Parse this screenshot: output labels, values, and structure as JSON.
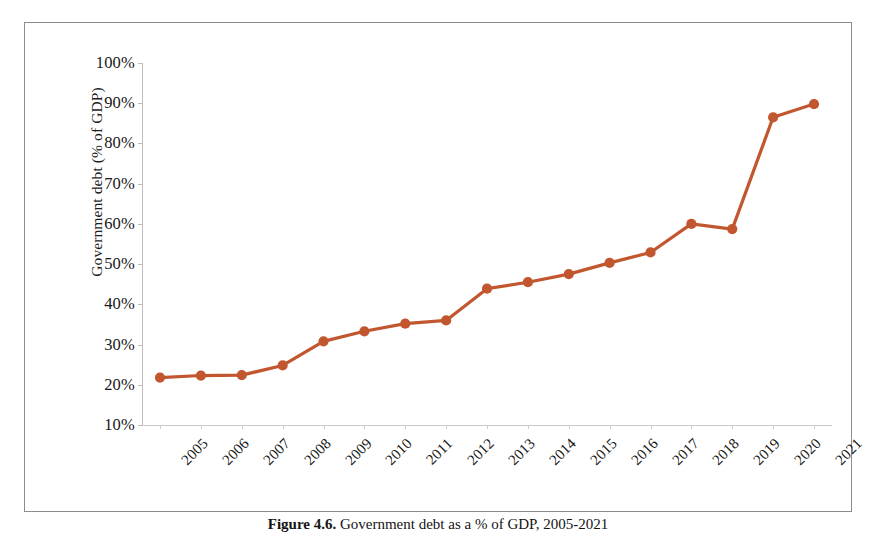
{
  "chart_data": {
    "type": "line",
    "title": "",
    "xlabel": "",
    "ylabel": "Government debt (% of GDP)",
    "categories": [
      "2005",
      "2006",
      "2007",
      "2008",
      "2009",
      "2010",
      "2011",
      "2012",
      "2013",
      "2014",
      "2015",
      "2016",
      "2017",
      "2018",
      "2019",
      "2020",
      "2021"
    ],
    "values": [
      21.8,
      22.3,
      22.4,
      24.8,
      30.8,
      33.3,
      35.2,
      36.0,
      43.9,
      45.5,
      47.5,
      50.3,
      52.9,
      60.0,
      58.7,
      86.5,
      89.8
    ],
    "series": [
      {
        "name": "Government debt (% of GDP)",
        "values": [
          21.8,
          22.3,
          22.4,
          24.8,
          30.8,
          33.3,
          35.2,
          36.0,
          43.9,
          45.5,
          47.5,
          50.3,
          52.9,
          60.0,
          58.7,
          86.5,
          89.8
        ]
      }
    ],
    "ylim": [
      10,
      100
    ],
    "ytick_labels": [
      "100%",
      "90%",
      "80%",
      "70%",
      "60%",
      "50%",
      "40%",
      "30%",
      "20%",
      "10%"
    ],
    "ytick_values": [
      100,
      90,
      80,
      70,
      60,
      50,
      40,
      30,
      20,
      10
    ],
    "grid": false,
    "legend": "none",
    "line_color": "#C2572F",
    "marker_color": "#C2572F",
    "marker_shape": "circle",
    "axis_color": "#BDBDBD",
    "xtick_rotation": -45
  },
  "caption": {
    "label": "Figure 4.6.",
    "text": "Government debt as a % of GDP, 2005-2021"
  }
}
